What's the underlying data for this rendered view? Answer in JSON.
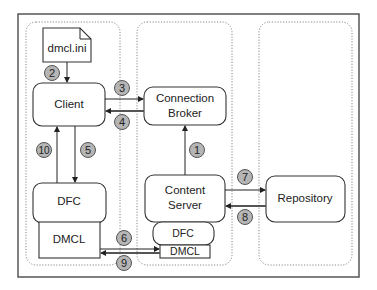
{
  "diagram": {
    "components": {
      "config_file": "dmcl.ini",
      "client": "Client",
      "client_dfc": "DFC",
      "client_dmcl": "DMCL",
      "connection_broker": [
        "Connection",
        "Broker"
      ],
      "content_server": [
        "Content",
        "Server"
      ],
      "server_dfc": "DFC",
      "server_dmcl": "DMCL",
      "repository": "Repository"
    },
    "steps": [
      {
        "id": "1",
        "from": "Content Server",
        "to": "Connection Broker"
      },
      {
        "id": "2",
        "from": "dmcl.ini",
        "to": "Client"
      },
      {
        "id": "3",
        "from": "Client",
        "to": "Connection Broker"
      },
      {
        "id": "4",
        "from": "Connection Broker",
        "to": "Client"
      },
      {
        "id": "5",
        "from": "Client",
        "to": "DFC"
      },
      {
        "id": "6",
        "from": "DMCL",
        "to": "Content Server DMCL"
      },
      {
        "id": "7",
        "from": "Content Server",
        "to": "Repository"
      },
      {
        "id": "8",
        "from": "Repository",
        "to": "Content Server"
      },
      {
        "id": "9",
        "from": "Content Server DMCL",
        "to": "DMCL"
      },
      {
        "id": "10",
        "from": "DFC",
        "to": "Client"
      }
    ],
    "colors": {
      "badge_fill": "#b5b5b5",
      "stroke": "#333333"
    }
  }
}
